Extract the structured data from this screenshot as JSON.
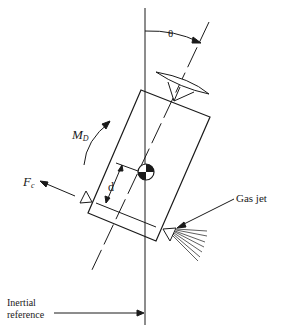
{
  "diagram": {
    "type": "satellite attitude control free-body diagram",
    "labels": {
      "theta": "θ",
      "moment": "M",
      "moment_sub": "D",
      "force": "F",
      "force_sub": "c",
      "distance": "d",
      "gas_jet": "Gas jet",
      "inertial_line1": "Inertial",
      "inertial_line2": "reference"
    },
    "colors": {
      "ink": "#1a1a1a",
      "background": "#ffffff"
    }
  }
}
